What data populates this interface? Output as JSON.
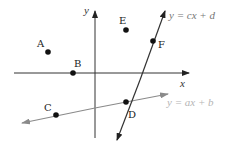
{
  "diagram": {
    "type": "coordinate-plane",
    "axes": {
      "x_label": "x",
      "y_label": "y"
    },
    "points": [
      {
        "label": "A"
      },
      {
        "label": "B"
      },
      {
        "label": "C"
      },
      {
        "label": "D"
      },
      {
        "label": "E"
      },
      {
        "label": "F"
      }
    ],
    "lines": [
      {
        "equation": "y = cx + d",
        "color": "#333333"
      },
      {
        "equation": "y = ax + b",
        "color": "#888888"
      }
    ]
  }
}
